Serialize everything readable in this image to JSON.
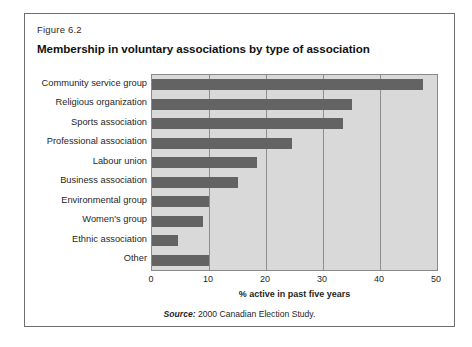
{
  "figure": {
    "number": "Figure 6.2",
    "title": "Membership in voluntary associations by type of association",
    "source_label": "Source:",
    "source_text": "2000 Canadian Election Study."
  },
  "colors": {
    "plot_background": "#d9d9d9",
    "bar_fill": "#636363",
    "gridline": "#8e8e8e",
    "frame_border": "#6e6e6e"
  },
  "chart_data": {
    "type": "bar",
    "orientation": "horizontal",
    "title": "Membership in voluntary associations by type of association",
    "subtitle": "Figure 6.2",
    "xlabel": "% active in past five years",
    "ylabel": "",
    "xlim": [
      0,
      50
    ],
    "xticks": [
      0,
      10,
      20,
      30,
      40,
      50
    ],
    "xtick_labels": [
      "0",
      "10",
      "20",
      "30",
      "40",
      "50"
    ],
    "grid": true,
    "legend": false,
    "categories": [
      "Community service group",
      "Religious organization",
      "Sports association",
      "Professional association",
      "Labour union",
      "Business association",
      "Environmental group",
      "Women's group",
      "Ethnic association",
      "Other"
    ],
    "values": [
      47.5,
      35,
      33.5,
      24.5,
      18.5,
      15,
      10,
      9,
      4.5,
      10
    ],
    "source": "Source: 2000 Canadian Election Study."
  }
}
